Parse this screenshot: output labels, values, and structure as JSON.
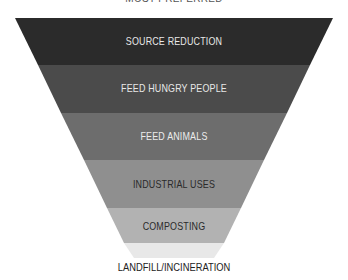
{
  "diagram": {
    "type": "inverted-pyramid",
    "top_label": "MOST PREFERRED",
    "bottom_label": "LANDFILL/INCINERATION",
    "levels": [
      {
        "label": "SOURCE REDUCTION",
        "color": "#2b2b2b",
        "text_color": "#e8e8e8"
      },
      {
        "label": "FEED HUNGRY PEOPLE",
        "color": "#4b4b4b",
        "text_color": "#e8e8e8"
      },
      {
        "label": "FEED ANIMALS",
        "color": "#6d6d6d",
        "text_color": "#ececec"
      },
      {
        "label": "INDUSTRIAL USES",
        "color": "#8f8f8f",
        "text_color": "#2a2a2a"
      },
      {
        "label": "COMPOSTING",
        "color": "#b2b2b2",
        "text_color": "#2a2a2a"
      },
      {
        "label": "",
        "color": "#e8e8e8",
        "text_color": "#2a2a2a"
      }
    ]
  }
}
